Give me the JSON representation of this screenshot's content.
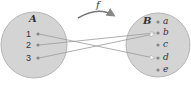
{
  "function_label": "f",
  "set_a": {
    "name": "A",
    "elements": [
      "1",
      "2",
      "3"
    ]
  },
  "set_b": {
    "name": "B",
    "elements": [
      "a",
      "b",
      "c",
      "d",
      "e"
    ]
  },
  "mapping": [
    {
      "from": "1",
      "to": "d"
    },
    {
      "from": "2",
      "to": "b"
    },
    {
      "from": "3",
      "to": "b"
    }
  ],
  "colors": {
    "set_fill": "#d4d4d4",
    "set_stroke": "#aaaaaa",
    "line": "#9a9a9a",
    "dot": "#888888"
  }
}
